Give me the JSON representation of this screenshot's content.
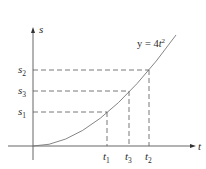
{
  "diagram": {
    "equation": {
      "lhs": "y = 4",
      "var": "t",
      "exp": "2"
    },
    "axes": {
      "x_label": "t",
      "y_label": "s"
    },
    "s_labels": [
      {
        "main": "s",
        "sub": "2"
      },
      {
        "main": "s",
        "sub": "3"
      },
      {
        "main": "s",
        "sub": "1"
      }
    ],
    "t_labels": [
      {
        "main": "t",
        "sub": "1"
      },
      {
        "main": "t",
        "sub": "3"
      },
      {
        "main": "t",
        "sub": "2"
      }
    ],
    "colors": {
      "line": "#555555",
      "curve": "#777777",
      "text": "#2a2a2a"
    }
  }
}
